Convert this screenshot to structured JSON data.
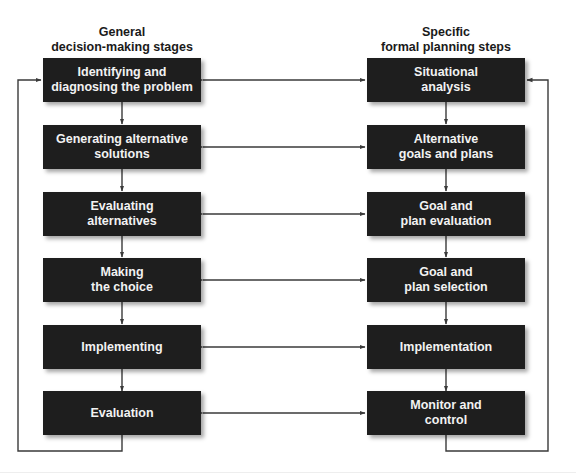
{
  "diagram": {
    "type": "parallel-process-flow",
    "left_column": {
      "header_line1": "General",
      "header_line2": "decision-making stages",
      "stages": [
        {
          "line1": "Identifying and",
          "line2": "diagnosing the problem"
        },
        {
          "line1": "Generating alternative",
          "line2": "solutions"
        },
        {
          "line1": "Evaluating",
          "line2": "alternatives"
        },
        {
          "line1": "Making",
          "line2": "the choice"
        },
        {
          "line1": "Implementing",
          "line2": ""
        },
        {
          "line1": "Evaluation",
          "line2": ""
        }
      ]
    },
    "right_column": {
      "header_line1": "Specific",
      "header_line2": "formal planning steps",
      "steps": [
        {
          "line1": "Situational",
          "line2": "analysis"
        },
        {
          "line1": "Alternative",
          "line2": "goals and plans"
        },
        {
          "line1": "Goal and",
          "line2": "plan evaluation"
        },
        {
          "line1": "Goal and",
          "line2": "plan selection"
        },
        {
          "line1": "Implementation",
          "line2": ""
        },
        {
          "line1": "Monitor and",
          "line2": "control"
        }
      ]
    },
    "connections": {
      "vertical_flow": "top-to-bottom arrows within each column",
      "horizontal_links": "bidirectional arrows between corresponding left and right boxes",
      "feedback_loops": "last box in each column loops back to the first box"
    },
    "colors": {
      "box_fill": "#1e1e1e",
      "box_text": "#f2f2f2",
      "line": "#3a3a3a",
      "header_text": "#1a1a1a",
      "background": "#ffffff"
    }
  }
}
